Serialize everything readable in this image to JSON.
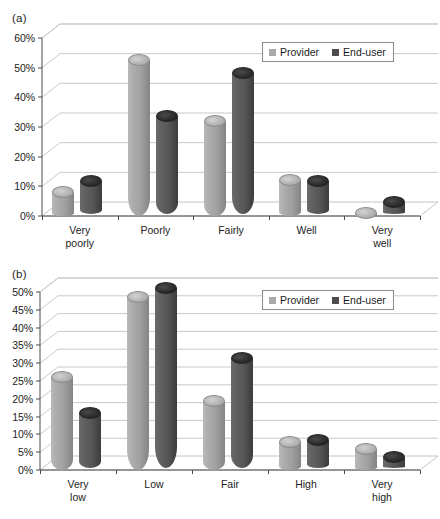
{
  "figure": {
    "panel_a_label": "(a)",
    "panel_b_label": "(b)",
    "colors": {
      "provider": "#a9a9a9",
      "enduser": "#4d4d4d",
      "axis": "#4a4a4a",
      "grid": "#c9c9c9"
    }
  },
  "legend": {
    "provider_label": "Provider",
    "enduser_label": "End-user"
  },
  "chart_data": [
    {
      "type": "bar",
      "panel": "(a)",
      "title": "",
      "xlabel": "",
      "ylabel": "",
      "categories": [
        "Very poorly",
        "Poorly",
        "Fairly",
        "Well",
        "Very well"
      ],
      "tick_labels": [
        "0%",
        "10%",
        "20%",
        "30%",
        "40%",
        "50%",
        "60%"
      ],
      "tick_values": [
        0,
        10,
        20,
        30,
        40,
        50,
        60
      ],
      "ylim": [
        0,
        60
      ],
      "grid": true,
      "legend_position": "top-right",
      "series": [
        {
          "name": "Provider",
          "color": "#a9a9a9",
          "values": [
            8,
            52.5,
            32,
            12,
            1
          ]
        },
        {
          "name": "End-user",
          "color": "#4d4d4d",
          "values": [
            11,
            33,
            47.5,
            11,
            4
          ]
        }
      ]
    },
    {
      "type": "bar",
      "panel": "(b)",
      "title": "",
      "xlabel": "",
      "ylabel": "",
      "categories": [
        "Very low",
        "Low",
        "Fair",
        "High",
        "Very high"
      ],
      "tick_labels": [
        "0%",
        "5%",
        "10%",
        "15%",
        "20%",
        "25%",
        "30%",
        "35%",
        "40%",
        "45%",
        "50%"
      ],
      "tick_values": [
        0,
        5,
        10,
        15,
        20,
        25,
        30,
        35,
        40,
        45,
        50
      ],
      "ylim": [
        0,
        50
      ],
      "grid": true,
      "legend_position": "top-right",
      "series": [
        {
          "name": "Provider",
          "color": "#a9a9a9",
          "values": [
            26,
            48.5,
            19.5,
            8,
            6
          ]
        },
        {
          "name": "End-user",
          "color": "#4d4d4d",
          "values": [
            15.5,
            50.5,
            31,
            8,
            3
          ]
        }
      ]
    }
  ]
}
